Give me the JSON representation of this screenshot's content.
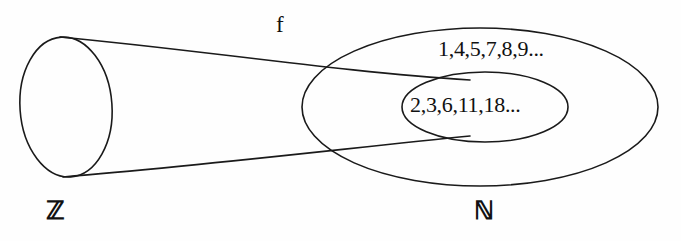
{
  "figure": {
    "kind": "set-mapping-diagram",
    "background_color": "#fefefe",
    "stroke_color": "#1a1a1a",
    "width": 681,
    "height": 241
  },
  "mapping": {
    "label": "f",
    "name": "function-arrow-label"
  },
  "domain": {
    "label": "ℤ",
    "shape": "cylinder",
    "name": "integers-set"
  },
  "codomain": {
    "label": "ℕ",
    "shape": "ellipse",
    "name": "naturals-set",
    "elements": "1,4,5,7,8,9..."
  },
  "subset": {
    "shape": "ellipse",
    "name": "image-subset",
    "elements": "2,3,6,11,18..."
  }
}
